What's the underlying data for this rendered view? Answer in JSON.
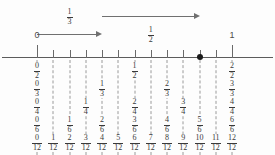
{
  "figure": {
    "axis": {
      "start_label": "0",
      "end_label": "1",
      "divisions": 12
    },
    "marked_point": {
      "name": "filled-dot",
      "position_twelfths": 10,
      "label": "10/12"
    },
    "jumps": [
      {
        "name": "jump-one-third",
        "label_numerator": "1",
        "label_denominator": "3",
        "from_twelfths": 0,
        "to_twelfths": 4,
        "label_position": "above"
      },
      {
        "name": "jump-one-half",
        "label_numerator": "1",
        "label_denominator": "2",
        "from_twelfths": 4,
        "to_twelfths": 10,
        "label_position": "below"
      }
    ],
    "columns": [
      {
        "index": 0,
        "position_twelfths": 0,
        "fractions": [
          {
            "numerator": "0",
            "denominator": "2"
          },
          {
            "numerator": "0",
            "denominator": "3"
          },
          {
            "numerator": "0",
            "denominator": "4"
          },
          {
            "numerator": "0",
            "denominator": "6"
          },
          {
            "numerator": "0",
            "denominator": "12"
          }
        ]
      },
      {
        "index": 1,
        "position_twelfths": 1,
        "fractions": [
          {
            "numerator": "1",
            "denominator": "12"
          }
        ]
      },
      {
        "index": 2,
        "position_twelfths": 2,
        "fractions": [
          {
            "numerator": "1",
            "denominator": "6"
          },
          {
            "numerator": "2",
            "denominator": "12"
          }
        ]
      },
      {
        "index": 3,
        "position_twelfths": 3,
        "fractions": [
          {
            "numerator": "1",
            "denominator": "4"
          },
          {
            "numerator": "3",
            "denominator": "12"
          }
        ]
      },
      {
        "index": 4,
        "position_twelfths": 4,
        "fractions": [
          {
            "numerator": "1",
            "denominator": "3"
          },
          {
            "numerator": "2",
            "denominator": "6"
          },
          {
            "numerator": "4",
            "denominator": "12"
          }
        ]
      },
      {
        "index": 5,
        "position_twelfths": 5,
        "fractions": [
          {
            "numerator": "5",
            "denominator": "12"
          }
        ]
      },
      {
        "index": 6,
        "position_twelfths": 6,
        "fractions": [
          {
            "numerator": "1",
            "denominator": "2"
          },
          {
            "numerator": "2",
            "denominator": "4"
          },
          {
            "numerator": "3",
            "denominator": "6"
          },
          {
            "numerator": "6",
            "denominator": "12"
          }
        ]
      },
      {
        "index": 7,
        "position_twelfths": 7,
        "fractions": [
          {
            "numerator": "7",
            "denominator": "12"
          }
        ]
      },
      {
        "index": 8,
        "position_twelfths": 8,
        "fractions": [
          {
            "numerator": "2",
            "denominator": "3"
          },
          {
            "numerator": "4",
            "denominator": "6"
          },
          {
            "numerator": "8",
            "denominator": "12"
          }
        ]
      },
      {
        "index": 9,
        "position_twelfths": 9,
        "fractions": [
          {
            "numerator": "3",
            "denominator": "4"
          },
          {
            "numerator": "9",
            "denominator": "12"
          }
        ]
      },
      {
        "index": 10,
        "position_twelfths": 10,
        "fractions": [
          {
            "numerator": "5",
            "denominator": "6"
          },
          {
            "numerator": "10",
            "denominator": "12"
          }
        ]
      },
      {
        "index": 11,
        "position_twelfths": 11,
        "fractions": [
          {
            "numerator": "11",
            "denominator": "12"
          }
        ]
      },
      {
        "index": 12,
        "position_twelfths": 12,
        "fractions": [
          {
            "numerator": "2",
            "denominator": "2"
          },
          {
            "numerator": "3",
            "denominator": "3"
          },
          {
            "numerator": "4",
            "denominator": "4"
          },
          {
            "numerator": "6",
            "denominator": "6"
          },
          {
            "numerator": "12",
            "denominator": "12"
          }
        ]
      }
    ],
    "colors": {
      "axis": "#5c5c5c",
      "tick": "#6a6a6a",
      "dot": "#1a1a1a",
      "arrow": "#707070",
      "dash": "#9a9a9a",
      "text": "#3a3a3a",
      "background": "#fdfdfd"
    }
  }
}
